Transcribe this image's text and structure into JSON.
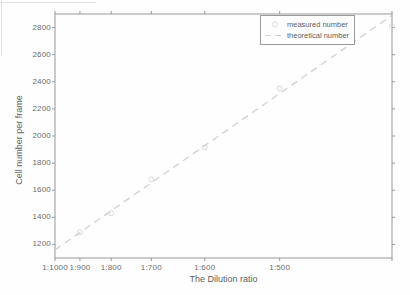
{
  "figure": {
    "xlabel": "The Dilution ratio",
    "ylabel": "Cell number per frame"
  },
  "colors": {
    "axis": "#979797",
    "tick_text": "#6b6b6b",
    "label_text": "#5f5f5f",
    "measured_marker": "#d3d6d8",
    "theoretical_line": "#ced2d5",
    "legend_border": "#9a9a9a",
    "background": "#fefefe"
  },
  "chart_data": {
    "type": "scatter",
    "title": "",
    "xlabel": "The Dilution ratio",
    "ylabel": "Cell number per frame",
    "x_axis": {
      "scale": "linear in concentration (1/dilution)",
      "xlim": [
        0.001,
        0.0025
      ],
      "ticks": [
        {
          "conc": 0.001,
          "label": "1:1000"
        },
        {
          "conc": 0.0011111,
          "label": "1:900"
        },
        {
          "conc": 0.00125,
          "label": "1:800"
        },
        {
          "conc": 0.0014286,
          "label": "1:700"
        },
        {
          "conc": 0.0016667,
          "label": "1:600"
        },
        {
          "conc": 0.002,
          "label": "1:500"
        },
        {
          "conc": 0.0025,
          "label": ""
        }
      ]
    },
    "y_axis": {
      "ylim": [
        1100,
        2900
      ],
      "ticks": [
        1200,
        1400,
        1600,
        1800,
        2000,
        2200,
        2400,
        2600,
        2800
      ]
    },
    "grid": false,
    "legend_position": "top-right",
    "series": [
      {
        "name": "measured number",
        "type": "scatter",
        "marker": "circle",
        "color": "#d3d6d8",
        "points_note": "[concentration (1/dilution), cells per frame]",
        "points": [
          [
            0.0011111,
            1290
          ],
          [
            0.00125,
            1430
          ],
          [
            0.0014286,
            1680
          ],
          [
            0.0016667,
            1915
          ],
          [
            0.002,
            2350
          ],
          [
            0.0025,
            2810
          ]
        ]
      },
      {
        "name": "theoretical number",
        "type": "line",
        "style": "dashed",
        "color": "#ced2d5",
        "points": [
          [
            0.001,
            1160
          ],
          [
            0.0025,
            2890
          ]
        ]
      }
    ]
  }
}
